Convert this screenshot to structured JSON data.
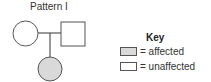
{
  "title": "Pattern I",
  "pedigree": {
    "parents": [
      {
        "sex": "female",
        "shape": "circle",
        "status": "unaffected"
      },
      {
        "sex": "male",
        "shape": "square",
        "status": "unaffected"
      }
    ],
    "children": [
      {
        "sex": "female",
        "shape": "circle",
        "status": "affected"
      }
    ]
  },
  "key": {
    "title": "Key",
    "items": [
      {
        "label": "= affected",
        "color": "#d9d9d9"
      },
      {
        "label": "= unaffected",
        "color": "#ffffff"
      }
    ]
  },
  "colors": {
    "affected": "#d9d9d9",
    "unaffected": "#ffffff",
    "stroke": "#555555"
  }
}
